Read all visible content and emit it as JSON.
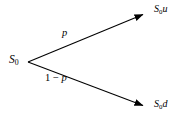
{
  "diagram": {
    "type": "binomial-tree-one-step",
    "background_color": "#ffffff",
    "stroke_color": "#000000",
    "nodes": {
      "root": {
        "symbol": "S",
        "subscript": "0",
        "suffix": "",
        "x": 28,
        "y": 62
      },
      "up": {
        "symbol": "S",
        "subscript": "0",
        "suffix": "u",
        "x": 147,
        "y": 13
      },
      "down": {
        "symbol": "S",
        "subscript": "0",
        "suffix": "d",
        "x": 147,
        "y": 107
      }
    },
    "edges": [
      {
        "name": "up-branch",
        "label_prefix": "",
        "label_var": "p",
        "from": "root",
        "to": "up",
        "x1": 28,
        "y1": 62,
        "x2": 147,
        "y2": 13
      },
      {
        "name": "down-branch",
        "label_prefix": "1 − ",
        "label_var": "p",
        "from": "root",
        "to": "down",
        "x1": 28,
        "y1": 62,
        "x2": 147,
        "y2": 107
      }
    ]
  }
}
